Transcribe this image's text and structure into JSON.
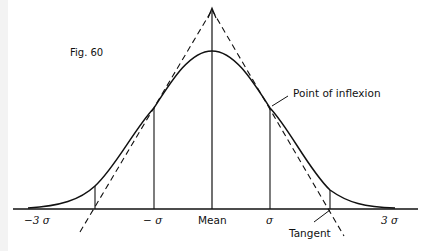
{
  "figure": {
    "title": "Fig. 60",
    "annotations": {
      "inflexion": "Point of inflexion",
      "tangent": "Tangent"
    },
    "axis_labels": {
      "minus3": "−3 σ",
      "minus1": "− σ",
      "mean": "Mean",
      "plus1": "σ",
      "plus3": "3 σ"
    },
    "colors": {
      "ink": "#111111",
      "background": "#ffffff"
    }
  }
}
